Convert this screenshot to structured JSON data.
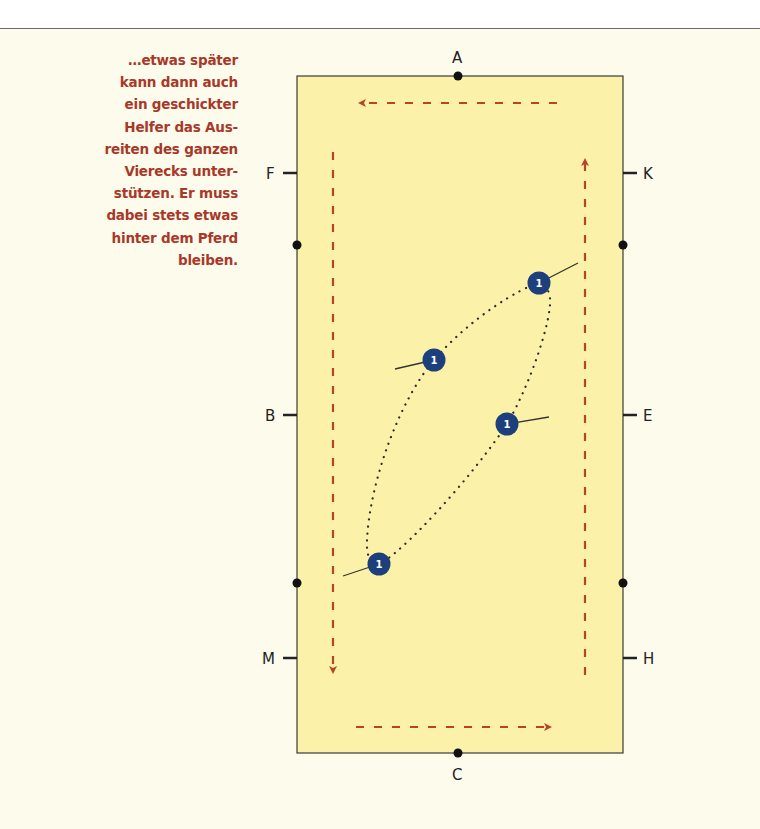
{
  "caption": {
    "lines": [
      "…etwas später",
      "kann dann auch",
      "ein geschickter",
      "Helfer das Aus-",
      "reiten des ganzen",
      "Vierecks unter-",
      "stützen. Er muss",
      "dabei stets etwas",
      "hinter dem Pferd",
      "bleiben."
    ]
  },
  "arena": {
    "markers": {
      "top": "A",
      "bottom": "C",
      "left_upper": "F",
      "left_middle": "B",
      "left_lower": "M",
      "right_upper": "K",
      "right_middle": "E",
      "right_lower": "H"
    },
    "rider_label": "1",
    "colors": {
      "arena_fill": "#fbf1a8",
      "arrow": "#b5442a",
      "rider": "#1d3f7c",
      "border": "#333333",
      "text": "#a8382a"
    }
  }
}
